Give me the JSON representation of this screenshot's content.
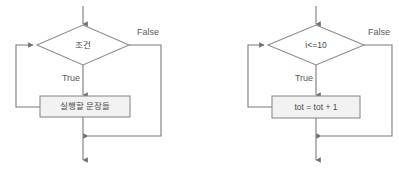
{
  "diagram": {
    "type": "flowchart",
    "colors": {
      "line": "#7a7a7a",
      "shape_stroke": "#8c8c8c",
      "process_fill": "#f2f2f2",
      "decision_fill": "#ffffff",
      "text": "#4a4a4a",
      "background": "#ffffff"
    },
    "charts": [
      {
        "id": "generic-while",
        "decision": {
          "label": "조건"
        },
        "process": {
          "label": "실행할 문장들"
        },
        "edges": {
          "true_label": "True",
          "false_label": "False"
        }
      },
      {
        "id": "concrete-while",
        "decision": {
          "label": "i<=10"
        },
        "process": {
          "label": "tot = tot + 1"
        },
        "edges": {
          "true_label": "True",
          "false_label": "False"
        }
      }
    ]
  }
}
